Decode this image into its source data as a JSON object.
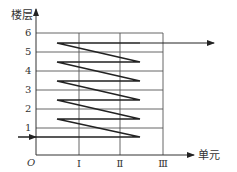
{
  "diagram": {
    "y_axis_label": "楼层",
    "x_axis_label": "单元",
    "origin_label": "O",
    "floor_labels": [
      "1",
      "2",
      "3",
      "4",
      "5",
      "6"
    ],
    "unit_labels": [
      "Ⅰ",
      "Ⅱ",
      "Ⅲ"
    ],
    "colors": {
      "line": "#222222",
      "grid": "#555555",
      "background": "#ffffff"
    }
  }
}
